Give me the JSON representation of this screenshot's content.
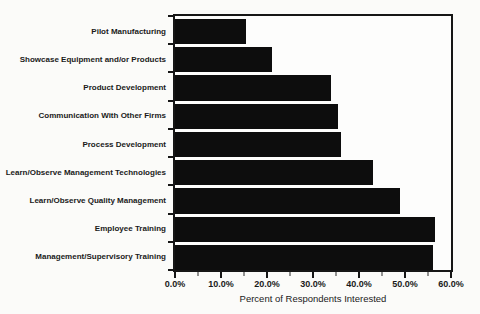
{
  "chart_data": {
    "type": "bar",
    "orientation": "horizontal",
    "title": "",
    "xlabel": "Percent of Respondents Interested",
    "ylabel": "",
    "xlim": [
      0,
      60
    ],
    "x_ticks": [
      "0.0%",
      "10.0%",
      "20.0%",
      "30.0%",
      "40.0%",
      "50.0%",
      "60.0%"
    ],
    "x_tick_values": [
      0,
      10,
      20,
      30,
      40,
      50,
      60
    ],
    "x_minor_tick_values": [
      5,
      15,
      25,
      35,
      45,
      55
    ],
    "grid": false,
    "legend": "none",
    "bar_color": "#0d0d0d",
    "background_color": "#fbfbf9",
    "categories": [
      "Pilot Manufacturing",
      "Showcase Equipment and/or Products",
      "Product Development",
      "Communication With Other Firms",
      "Process Development",
      "Learn/Observe Management Technologies",
      "Learn/Observe Quality Management",
      "Employee Training",
      "Management/Supervisory Training"
    ],
    "values": [
      15.5,
      21,
      34,
      35.5,
      36,
      43,
      49,
      56.5,
      56
    ]
  }
}
